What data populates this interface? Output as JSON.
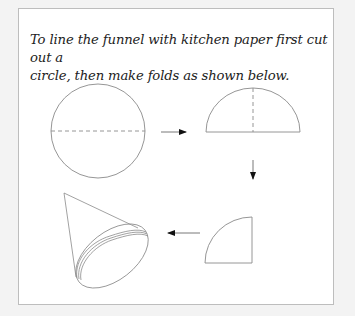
{
  "instructions": {
    "line1": "To line the funnel with kitchen paper first cut out a",
    "line2": "circle, then make folds as shown below."
  },
  "diagram": {
    "steps": [
      {
        "name": "circle",
        "description": "circle with dashed horizontal fold line"
      },
      {
        "name": "semicircle",
        "description": "half circle with dashed vertical fold line"
      },
      {
        "name": "quarter-circle",
        "description": "quarter circle"
      },
      {
        "name": "cone",
        "description": "opened paper cone funnel liner"
      }
    ],
    "arrows": [
      "right",
      "down",
      "left"
    ],
    "colors": {
      "line": "#8a8a8a",
      "arrow": "#111111",
      "border": "#bdbdbd"
    }
  }
}
